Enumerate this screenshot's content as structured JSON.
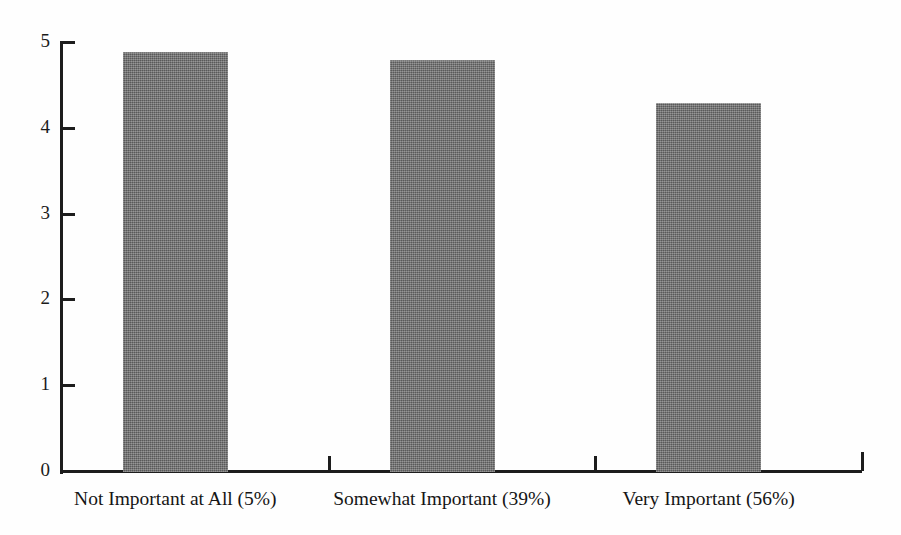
{
  "chart_data": {
    "type": "bar",
    "title": "",
    "subtitle": "",
    "xlabel": "",
    "ylabel": "",
    "categories": [
      "Not Important at All (5%)",
      "Somewhat Important (39%)",
      "Very Important (56%)"
    ],
    "values": [
      4.9,
      4.8,
      4.3
    ],
    "ylim": [
      0,
      5
    ],
    "ytick_labels": [
      "0",
      "1",
      "2",
      "3",
      "4",
      "5"
    ],
    "ytick_values": [
      0,
      1,
      2,
      3,
      4,
      5
    ],
    "grid": false,
    "legend": false,
    "legend_position": "none",
    "bar_color": "#6d6d6d",
    "axis_color": "#1d1d1d",
    "background_color": "#fefefe"
  },
  "axes": {
    "y_axis_name": "y-axis",
    "x_axis_name": "x-axis"
  }
}
